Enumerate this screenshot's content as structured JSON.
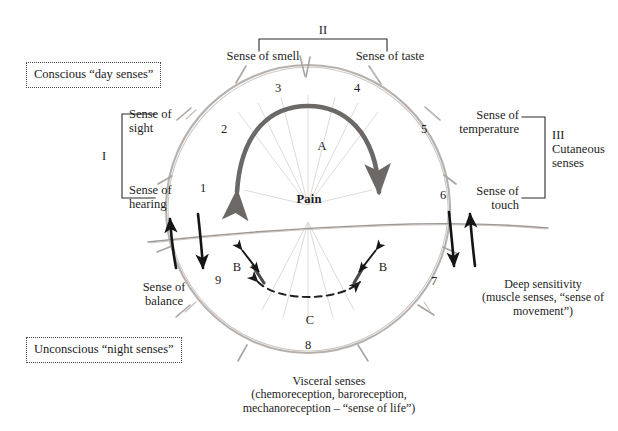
{
  "diagram": {
    "title_boxes": {
      "conscious": "Conscious “day senses”",
      "unconscious": "Unconscious “night senses”"
    },
    "groups": {
      "I": {
        "roman": "I",
        "top_label": "Sense of\nsight",
        "bottom_label": "Sense of\nhearing"
      },
      "II": {
        "roman": "II",
        "left_label": "Sense of smell",
        "right_label": "Sense of taste"
      },
      "III": {
        "roman": "III",
        "name": "III\nCutaneous\nsenses",
        "top_label": "Sense of\ntemperature",
        "bottom_label": "Sense of\ntouch"
      }
    },
    "side_labels": {
      "balance": "Sense of\nbalance",
      "deep_sensitivity": "Deep sensitivity\n(muscle senses, “sense of\nmovement”)",
      "visceral": "Visceral senses\n(chemoreception, baroreception,\nmechanoreception – “sense of life”)"
    },
    "center": {
      "pain": "Pain",
      "arc_A": "A",
      "arc_C": "C",
      "link_B_left": "B",
      "link_B_right": "B"
    },
    "sector_numbers": [
      "1",
      "2",
      "3",
      "4",
      "5",
      "6",
      "7",
      "8",
      "9"
    ],
    "colors": {
      "ink": "#1d1d1d",
      "circle": "#b9b4b0",
      "arc_dark": "#5d5a58",
      "arrow_black": "#151515",
      "box_border": "#4a4a4a",
      "background": "#ffffff"
    }
  }
}
